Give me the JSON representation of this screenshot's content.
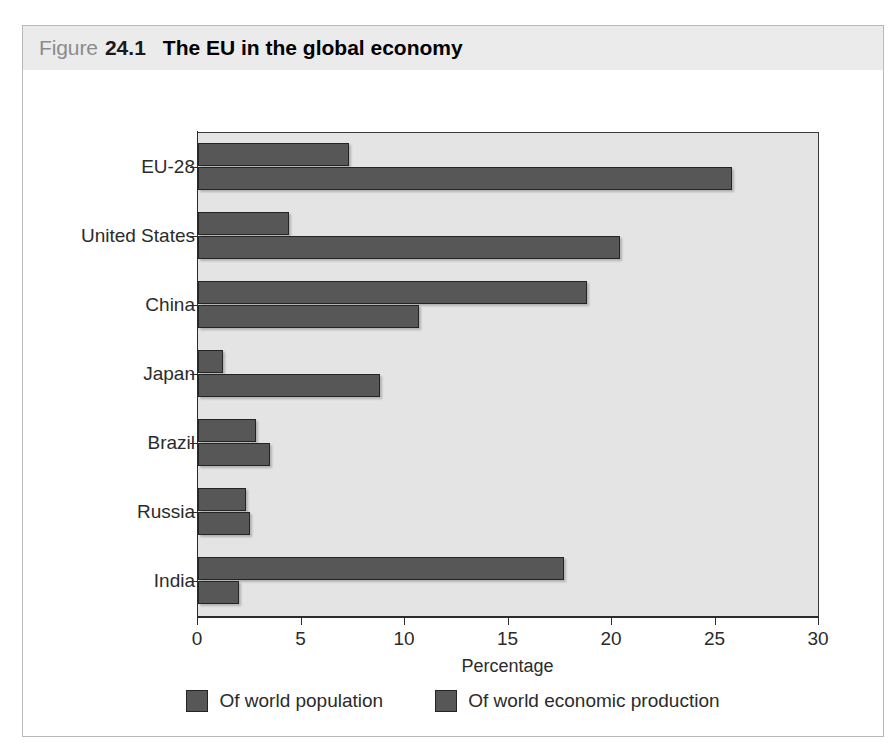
{
  "figure": {
    "label_word": "Figure",
    "number": "24.1",
    "title": "The EU in the global economy"
  },
  "chart_data": {
    "type": "bar",
    "orientation": "horizontal",
    "title": "The EU in the global economy",
    "xlabel": "Percentage",
    "ylabel": "",
    "xlim": [
      0,
      30
    ],
    "xticks": [
      0,
      5,
      10,
      15,
      20,
      25,
      30
    ],
    "xtick_labels": [
      "0",
      "5",
      "10",
      "15",
      "20",
      "25",
      "30"
    ],
    "grid": false,
    "legend_position": "bottom",
    "categories": [
      "EU-28",
      "United States",
      "China",
      "Japan",
      "Brazil",
      "Russia",
      "India"
    ],
    "series": [
      {
        "name": "Of world population",
        "color": "#575757",
        "values": [
          7.3,
          4.4,
          18.8,
          1.2,
          2.8,
          2.3,
          17.7
        ]
      },
      {
        "name": "Of world economic production",
        "color": "#575757",
        "values": [
          25.8,
          20.4,
          10.7,
          8.8,
          3.5,
          2.5,
          2.0
        ]
      }
    ],
    "legend": [
      "Of world population",
      "Of world economic production"
    ]
  },
  "colors": {
    "bar": "#575757",
    "bar_border": "#242424",
    "plot_background": "#e4e4e4",
    "title_band": "#ebebeb",
    "frame_border": "#b9b9b9",
    "axis": "#2b2b2b",
    "figure_word": "#8b8b8b"
  }
}
